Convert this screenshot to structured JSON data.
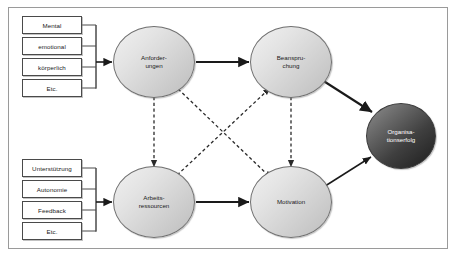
{
  "diagram": {
    "frame_border_color": "#9a9a9a",
    "background_color": "#ffffff",
    "node_fill_light": "#dcdcdc",
    "node_fill_dark": "#3f3f3f",
    "solid_arrow_color": "#1a1a1a",
    "dashed_arrow_color": "#2a2a2a"
  },
  "demand_factors": {
    "group_name": "Anforderungen-Faktoren",
    "items": [
      {
        "label": "Mental"
      },
      {
        "label": "emotional"
      },
      {
        "label": "körperlich"
      },
      {
        "label": "Etc."
      }
    ]
  },
  "resource_factors": {
    "group_name": "Arbeitsressourcen-Faktoren",
    "items": [
      {
        "label": "Unterstützung"
      },
      {
        "label": "Autonomie"
      },
      {
        "label": "Feedback"
      },
      {
        "label": "Etc."
      }
    ]
  },
  "nodes": [
    {
      "id": "anforderungen",
      "lines": [
        "Anforder-",
        "ungen"
      ],
      "style": "light"
    },
    {
      "id": "beanspruchung",
      "lines": [
        "Beanspru-",
        "chung"
      ],
      "style": "light"
    },
    {
      "id": "arbeitsressourcen",
      "lines": [
        "Arbeits-",
        "ressourcen"
      ],
      "style": "light"
    },
    {
      "id": "motivation",
      "lines": [
        "Motivation"
      ],
      "style": "light"
    },
    {
      "id": "organisationserfolg",
      "lines": [
        "Organisa-",
        "tionserfolg"
      ],
      "style": "dark"
    }
  ],
  "connections": [
    {
      "from": "demand_factors",
      "to": "anforderungen",
      "type": "solid",
      "direction": "one-way"
    },
    {
      "from": "resource_factors",
      "to": "arbeitsressourcen",
      "type": "solid",
      "direction": "one-way"
    },
    {
      "from": "anforderungen",
      "to": "beanspruchung",
      "type": "solid",
      "direction": "one-way"
    },
    {
      "from": "arbeitsressourcen",
      "to": "motivation",
      "type": "solid",
      "direction": "one-way"
    },
    {
      "from": "beanspruchung",
      "to": "organisationserfolg",
      "type": "solid",
      "direction": "one-way"
    },
    {
      "from": "motivation",
      "to": "organisationserfolg",
      "type": "solid",
      "direction": "one-way"
    },
    {
      "from": "anforderungen",
      "to": "arbeitsressourcen",
      "type": "dashed",
      "direction": "two-way"
    },
    {
      "from": "beanspruchung",
      "to": "motivation",
      "type": "dashed",
      "direction": "two-way"
    },
    {
      "from": "arbeitsressourcen",
      "to": "beanspruchung",
      "type": "dashed",
      "direction": "one-way"
    },
    {
      "from": "anforderungen",
      "to": "motivation",
      "type": "dashed",
      "direction": "one-way"
    }
  ]
}
